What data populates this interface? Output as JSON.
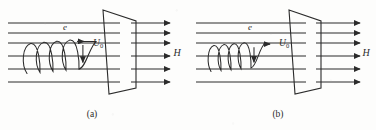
{
  "figure": {
    "background_color": "#fdfdfc",
    "line_color": "#2b2b2b",
    "panels": [
      {
        "id": "a",
        "caption": "(a)",
        "origin_x": 0,
        "labels": {
          "electron": "e",
          "velocity": "U",
          "velocity_subscript": "0",
          "field": "H"
        },
        "field_lines_y": [
          23,
          33,
          43,
          56,
          69,
          82
        ],
        "field_line_x_start": 8,
        "field_line_x_end": 120,
        "arrow_lines_x_start": 131,
        "arrow_lines_x_end": 170,
        "plate": {
          "top_left_x": 103,
          "top_left_y": 10,
          "top_right_x": 136,
          "top_right_y": 21,
          "bottom_right_x": 136,
          "bottom_right_y": 88,
          "bottom_left_x": 109,
          "bottom_left_y": 94
        },
        "helix": {
          "loop_count": 4,
          "loop_width": 13,
          "loop_height": 30,
          "start_x": 27,
          "center_y": 54,
          "tilt": 9
        },
        "electron_label_x": 65,
        "electron_label_y": 30,
        "velocity_label_x": 93,
        "velocity_label_y": 46,
        "field_label_x": 177,
        "field_label_y": 56,
        "caption_x": 92,
        "caption_y": 117
      },
      {
        "id": "b",
        "caption": "(b)",
        "origin_x": 188,
        "labels": {
          "electron": "e",
          "velocity": "U",
          "velocity_subscript": "0",
          "field": "H"
        },
        "field_lines_y": [
          23,
          33,
          43,
          56,
          69,
          82
        ],
        "field_line_x_start": 8,
        "field_line_x_end": 118,
        "arrow_lines_x_start": 128,
        "arrow_lines_x_end": 172,
        "plate": {
          "top_left_x": 101,
          "top_left_y": 10,
          "top_right_x": 133,
          "top_right_y": 21,
          "bottom_right_x": 133,
          "bottom_right_y": 88,
          "bottom_left_x": 107,
          "bottom_left_y": 94
        },
        "helix": {
          "loop_count": 4,
          "loop_width": 10,
          "loop_height": 26,
          "start_x": 23,
          "center_y": 55,
          "tilt": 7
        },
        "electron_label_x": 62,
        "electron_label_y": 30,
        "velocity_label_x": 91,
        "velocity_label_y": 46,
        "field_label_x": 178,
        "field_label_y": 56,
        "caption_x": 90,
        "caption_y": 117
      }
    ]
  }
}
